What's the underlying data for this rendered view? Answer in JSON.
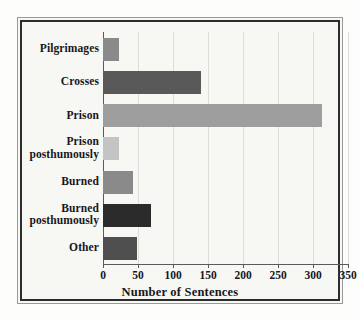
{
  "chart_data": {
    "type": "bar",
    "orientation": "horizontal",
    "title": "",
    "xlabel": "Number of Sentences",
    "ylabel": "",
    "xlim": [
      0,
      350
    ],
    "xticks": [
      0,
      50,
      100,
      150,
      200,
      250,
      300,
      350
    ],
    "grid": true,
    "grid_axis": "x",
    "legend": false,
    "categories": [
      "Pilgrimages",
      "Crosses",
      "Prison",
      "Prison posthumously",
      "Burned",
      "Burned posthumously",
      "Other"
    ],
    "values": [
      20,
      137,
      310,
      20,
      40,
      65,
      46
    ],
    "bar_colors": [
      "#8a8a8a",
      "#595959",
      "#9e9e9e",
      "#c4c4c4",
      "#8a8a8a",
      "#2b2b2b",
      "#4f4f4f"
    ]
  },
  "axis": {
    "x_label": "Number of Sentences",
    "tick_labels": [
      "0",
      "50",
      "100",
      "150",
      "200",
      "250",
      "300",
      "350"
    ]
  },
  "category_labels": [
    {
      "line1": "Pilgrimages",
      "line2": ""
    },
    {
      "line1": "Crosses",
      "line2": ""
    },
    {
      "line1": "Prison",
      "line2": ""
    },
    {
      "line1": "Prison",
      "line2": "posthumously"
    },
    {
      "line1": "Burned",
      "line2": ""
    },
    {
      "line1": "Burned",
      "line2": "posthumously"
    },
    {
      "line1": "Other",
      "line2": ""
    }
  ],
  "style": {
    "background": "#f7f7f4",
    "frame_color": "#2c2c2c",
    "grid_color": "#dcdcd8",
    "axis_color": "#5a5a5a",
    "text_color": "#17171a"
  }
}
